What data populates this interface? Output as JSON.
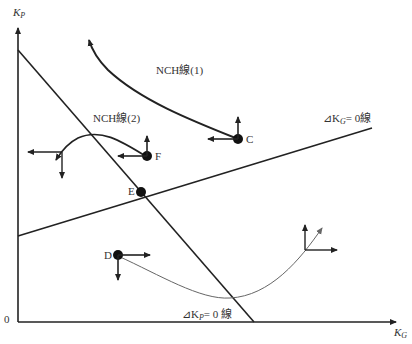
{
  "axes": {
    "y_label": "K",
    "y_sub": "P",
    "x_label": "K",
    "x_sub": "G",
    "origin": "0"
  },
  "lines": {
    "dkg_zero": {
      "prefix": "⊿K",
      "sub": "G",
      "suffix": "= 0線"
    },
    "dkp_zero": {
      "prefix": "⊿K",
      "sub": "P",
      "suffix": "= 0 線"
    },
    "nch1": "NCH線(1)",
    "nch2": "NCH線(2)"
  },
  "points": {
    "C": "C",
    "D": "D",
    "E": "E",
    "F": "F"
  },
  "colors": {
    "line": "#222222",
    "thin_curve": "#666666",
    "text": "#333333"
  }
}
